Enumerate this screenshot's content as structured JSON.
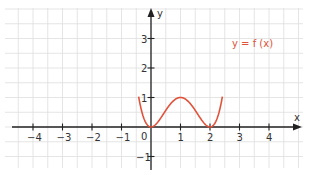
{
  "chart_data": {
    "type": "line",
    "title": "",
    "function_label": "y = f (x)",
    "function_expression": "x^2 (x - 2)^2",
    "xlabel": "x",
    "ylabel": "y",
    "xlim": [
      -4.8,
      5.2
    ],
    "ylim": [
      -1.4,
      4.0
    ],
    "x_ticks": [
      -4,
      -3,
      -2,
      -1,
      1,
      2,
      3,
      4
    ],
    "x_tick_labels": [
      "−4",
      "−3",
      "−2",
      "−1",
      "1",
      "2",
      "3",
      "4"
    ],
    "y_ticks": [
      -1,
      1,
      2,
      3
    ],
    "y_tick_labels": [
      "−1",
      "1",
      "2",
      "3"
    ],
    "origin_label": "0",
    "grid": true,
    "grid_step": 0.5,
    "series": [
      {
        "name": "y = f (x)",
        "color": "#e0523a",
        "x": [
          -0.35,
          -0.25,
          0,
          0.25,
          0.5,
          0.75,
          1,
          1.25,
          1.5,
          1.75,
          2,
          2.25,
          2.35
        ],
        "y": [
          0.93,
          0.32,
          0,
          0.19,
          0.56,
          0.86,
          1,
          0.86,
          0.56,
          0.19,
          0,
          0.32,
          0.67
        ]
      }
    ],
    "key_points": [
      {
        "label": "local minimum",
        "x": 0,
        "y": 0
      },
      {
        "label": "local maximum",
        "x": 1,
        "y": 1
      },
      {
        "label": "local minimum",
        "x": 2,
        "y": 0
      }
    ]
  },
  "colors": {
    "curve": "#e0523a",
    "axis": "#222222",
    "grid": "#dedede"
  }
}
